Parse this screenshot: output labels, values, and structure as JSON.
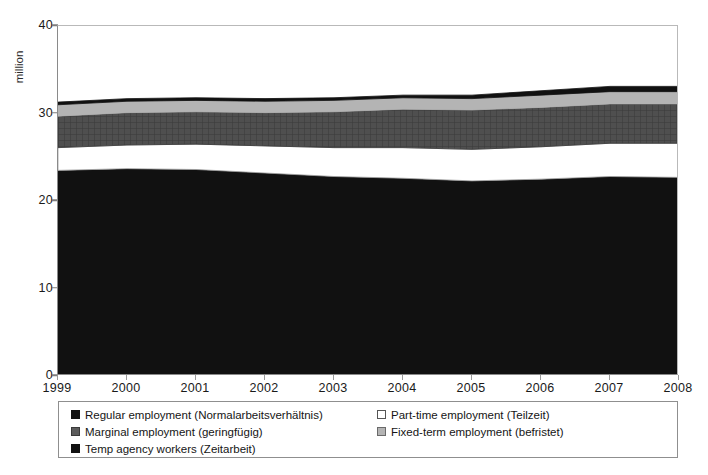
{
  "chart_data": {
    "type": "area",
    "stacked": true,
    "title": "",
    "xlabel": "",
    "ylabel": "million",
    "ylim": [
      0,
      40
    ],
    "yticks": [
      0,
      10,
      20,
      30,
      40
    ],
    "grid": false,
    "legend_position": "bottom",
    "categories": [
      "1999",
      "2000",
      "2001",
      "2002",
      "2003",
      "2004",
      "2005",
      "2006",
      "2007",
      "2008"
    ],
    "x": [
      1999,
      2000,
      2001,
      2002,
      2003,
      2004,
      2005,
      2006,
      2007,
      2008
    ],
    "series": [
      {
        "name": "Regular employment (Normalarbeitsverhältnis)",
        "color": "#111111",
        "pattern": "solid",
        "values": [
          23.5,
          23.7,
          23.6,
          23.2,
          22.8,
          22.6,
          22.3,
          22.5,
          22.8,
          22.7
        ]
      },
      {
        "name": "Part-time employment (Teilzeit)",
        "color": "#ffffff",
        "pattern": "solid",
        "values": [
          2.6,
          2.7,
          2.9,
          3.1,
          3.3,
          3.5,
          3.6,
          3.7,
          3.8,
          3.9
        ]
      },
      {
        "name": "Marginal employment (geringfügig)",
        "color": "#4f4f4f",
        "pattern": "crosshatch",
        "values": [
          3.6,
          3.7,
          3.7,
          3.8,
          4.1,
          4.4,
          4.5,
          4.5,
          4.5,
          4.5
        ]
      },
      {
        "name": "Fixed-term employment (befristet)",
        "color": "#b4b4b4",
        "pattern": "solid",
        "values": [
          1.3,
          1.3,
          1.3,
          1.3,
          1.3,
          1.3,
          1.3,
          1.4,
          1.4,
          1.4
        ]
      },
      {
        "name": "Temp agency workers (Zeitarbeit)",
        "color": "#111111",
        "pattern": "solid",
        "values": [
          0.3,
          0.3,
          0.3,
          0.3,
          0.3,
          0.3,
          0.4,
          0.5,
          0.6,
          0.6
        ]
      }
    ],
    "totals": [
      31.3,
      31.7,
      31.8,
      31.7,
      31.8,
      32.1,
      32.1,
      32.6,
      33.1,
      33.1
    ]
  },
  "axes": {
    "y_title": "million",
    "y_tick_labels": [
      "40",
      "30",
      "20",
      "10",
      "0"
    ],
    "x_tick_labels": [
      "1999",
      "2000",
      "2001",
      "2002",
      "2003",
      "2004",
      "2005",
      "2006",
      "2007",
      "2008"
    ]
  },
  "legend": {
    "left_column": [
      {
        "label": "Regular employment (Normalarbeitsverhältnis)",
        "swatch": "sw-regular"
      },
      {
        "label": "Marginal employment (geringfügig)",
        "swatch": "sw-marginal"
      },
      {
        "label": "Temp agency workers (Zeitarbeit)",
        "swatch": "sw-temp"
      }
    ],
    "right_column": [
      {
        "label": "Part-time employment (Teilzeit)",
        "swatch": "sw-parttime"
      },
      {
        "label": "Fixed-term employment (befristet)",
        "swatch": "sw-fixed"
      }
    ]
  },
  "colors": {
    "regular": "#111111",
    "part_time": "#ffffff",
    "marginal": "#4f4f4f",
    "fixed_term": "#b4b4b4",
    "temp_agency": "#111111",
    "axis": "#8a8a8a",
    "text": "#1a1a1a"
  }
}
